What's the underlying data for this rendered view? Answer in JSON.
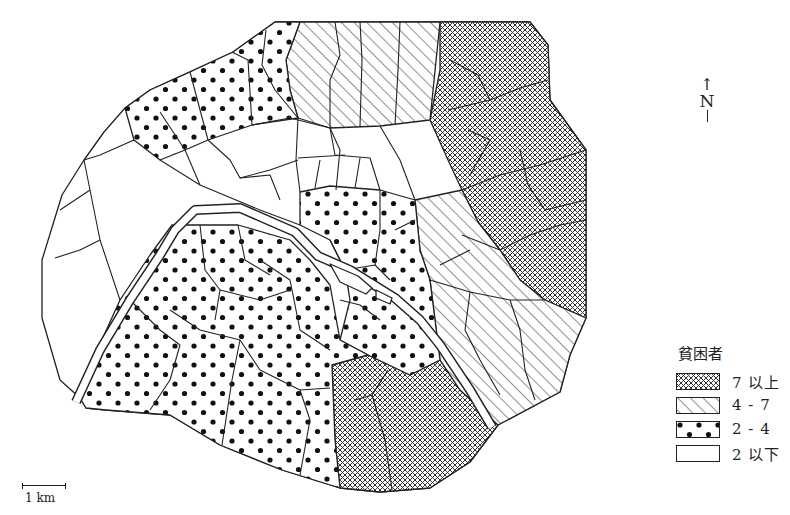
{
  "map": {
    "subject": "Paris arrondissement quarters - poverty rate",
    "north_label": "N",
    "north_arrow": "↑",
    "scale_label": "1 km"
  },
  "legend": {
    "title": "貧困者",
    "items": [
      {
        "label": "7 以上",
        "pattern": "crosshatch"
      },
      {
        "label": "4 - 7",
        "pattern": "diagonal-lines"
      },
      {
        "label": "2 - 4",
        "pattern": "dots"
      },
      {
        "label": "2 以下",
        "pattern": "blank"
      }
    ]
  },
  "colors": {
    "line": "#222222",
    "background": "#ffffff"
  }
}
